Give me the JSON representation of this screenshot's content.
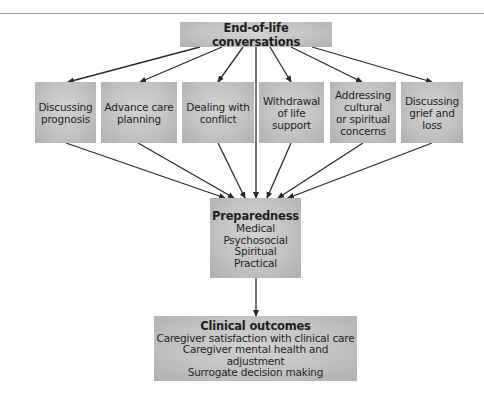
{
  "diagram": {
    "top": {
      "title": "End-of-life conversations"
    },
    "topics": [
      {
        "lines": [
          "Discussing",
          "prognosis"
        ]
      },
      {
        "lines": [
          "Advance care",
          "planning"
        ]
      },
      {
        "lines": [
          "Dealing with",
          "conflict"
        ]
      },
      {
        "lines": [
          "Withdrawal",
          "of life",
          "support"
        ]
      },
      {
        "lines": [
          "Addressing",
          "cultural",
          "or spiritual",
          "concerns"
        ]
      },
      {
        "lines": [
          "Discussing",
          "grief and",
          "loss"
        ]
      }
    ],
    "preparedness": {
      "title": "Preparedness",
      "items": [
        "Medical",
        "Psychosocial",
        "Spiritual",
        "Practical"
      ]
    },
    "outcomes": {
      "title": "Clinical outcomes",
      "items": [
        "Caregiver satisfaction with clinical care",
        "Caregiver mental health and adjustment",
        "Surrogate decision making"
      ]
    },
    "colors": {
      "box": "#c2c2c2",
      "box_highlight": "#d2d2d2",
      "arrow": "#2a2a2a",
      "rule": "#9a9a9a"
    }
  }
}
